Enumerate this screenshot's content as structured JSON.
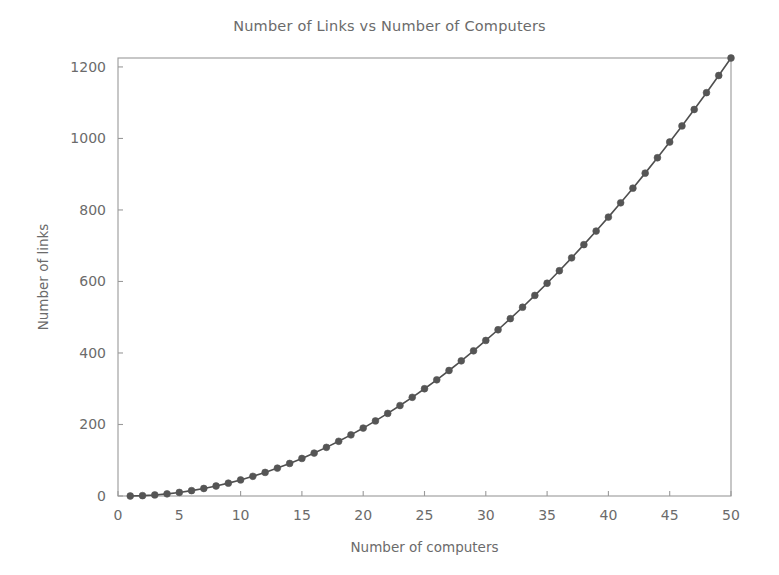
{
  "figure": {
    "background_color": "#ffffff",
    "width": 779,
    "height": 575
  },
  "chart_data": {
    "type": "line",
    "title": "Number of Links vs Number of Computers",
    "xlabel": "Number of computers",
    "ylabel": "Number of links",
    "xlim": [
      0,
      50
    ],
    "ylim": [
      0,
      1225
    ],
    "grid": false,
    "legend": false,
    "line_color": "#4f4f4f",
    "marker_color": "#555555",
    "marker_style": "circle",
    "xticks": [
      0,
      5,
      10,
      15,
      20,
      25,
      30,
      35,
      40,
      45,
      50
    ],
    "xtick_labels": [
      "0",
      "5",
      "10",
      "15",
      "20",
      "25",
      "30",
      "35",
      "40",
      "45",
      "50"
    ],
    "yticks": [
      0,
      200,
      400,
      600,
      800,
      1000,
      1200
    ],
    "ytick_labels": [
      "0",
      "200",
      "400",
      "600",
      "800",
      "1000",
      "1200"
    ],
    "series": [
      {
        "name": "links",
        "formula": "n(n-1)/2",
        "x": [
          1,
          2,
          3,
          4,
          5,
          6,
          7,
          8,
          9,
          10,
          11,
          12,
          13,
          14,
          15,
          16,
          17,
          18,
          19,
          20,
          21,
          22,
          23,
          24,
          25,
          26,
          27,
          28,
          29,
          30,
          31,
          32,
          33,
          34,
          35,
          36,
          37,
          38,
          39,
          40,
          41,
          42,
          43,
          44,
          45,
          46,
          47,
          48,
          49,
          50
        ],
        "values": [
          0,
          1,
          3,
          6,
          10,
          15,
          21,
          28,
          36,
          45,
          55,
          66,
          78,
          91,
          105,
          120,
          136,
          153,
          171,
          190,
          210,
          231,
          253,
          276,
          300,
          325,
          351,
          378,
          406,
          435,
          465,
          496,
          528,
          561,
          595,
          630,
          666,
          703,
          741,
          780,
          820,
          861,
          903,
          946,
          990,
          1035,
          1081,
          1128,
          1176,
          1225
        ]
      }
    ]
  }
}
